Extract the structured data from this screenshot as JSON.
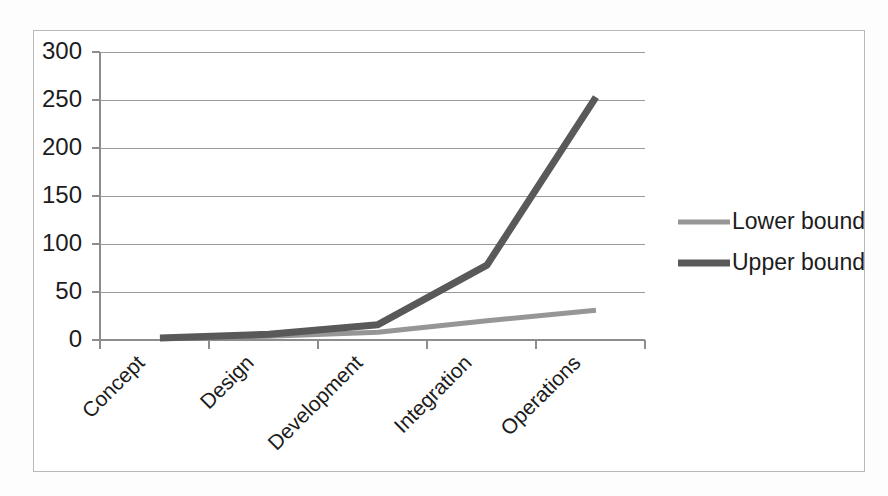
{
  "chart_data": {
    "type": "line",
    "title": "",
    "subtitle": "",
    "xlabel": "",
    "ylabel": "",
    "categories": [
      "Concept",
      "Design",
      "Development",
      "Integration",
      "Operations"
    ],
    "series": [
      {
        "name": "Lower bound",
        "color": "#969696",
        "stroke_width": 5,
        "values": [
          1.5,
          4,
          8,
          20,
          31
        ]
      },
      {
        "name": "Upper bound",
        "color": "#595959",
        "stroke_width": 7,
        "values": [
          2,
          6,
          16,
          78,
          253
        ]
      }
    ],
    "ylim": [
      0,
      300
    ],
    "yticks": [
      0,
      50,
      100,
      150,
      200,
      250,
      300
    ],
    "ytick_labels": [
      "0",
      "50",
      "100",
      "150",
      "200",
      "250",
      "300"
    ],
    "grid": true,
    "grid_axis": "y",
    "legend_position": "right",
    "legend_entries": [
      "Lower bound",
      "Upper bound"
    ],
    "x_label_rotation": -45,
    "annotations": []
  },
  "legend": {
    "items": [
      {
        "label": "Lower bound",
        "color": "#969696",
        "width": 5
      },
      {
        "label": "Upper bound",
        "color": "#595959",
        "width": 7
      }
    ]
  },
  "axes": {
    "y_ticks": [
      "300",
      "250",
      "200",
      "150",
      "100",
      "50",
      "0"
    ],
    "x_categories": [
      "Concept",
      "Design",
      "Development",
      "Integration",
      "Operations"
    ]
  },
  "colors": {
    "background": "#ffffff",
    "frame_border": "#b9b9b9",
    "grid": "#9a9a9a",
    "axis": "#8d8d8d",
    "text": "#1c1c1c",
    "lower_bound": "#969696",
    "upper_bound": "#595959"
  }
}
